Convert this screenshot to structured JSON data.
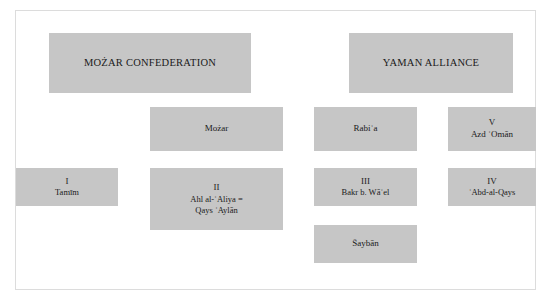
{
  "figure": {
    "type": "tribal-genealogy-diagram",
    "background_color": "#ffffff",
    "box_fill_color": "#c6c6c6",
    "border_color": "#dcdcdc",
    "text_color": "#1a1a1a"
  },
  "nodes": {
    "mozar_confederation": {
      "label": "MOŻAR CONFEDERATION"
    },
    "yaman_alliance": {
      "label": "YAMAN ALLIANCE"
    },
    "mozar": {
      "label": "Możar"
    },
    "rabia": {
      "label": "Rabiʿa"
    },
    "azd_oman": {
      "numeral": "V",
      "label": "Azd ʿOmān"
    },
    "tamim": {
      "numeral": "I",
      "label": "Tamīm"
    },
    "ahl_al_aliya": {
      "numeral": "II",
      "label_line1": "Ahl al-ʿAliya =",
      "label_line2": "Qays ʿAylān"
    },
    "bakr": {
      "numeral": "III",
      "label": "Bakr b. Wāʾel"
    },
    "abd_al_qays": {
      "numeral": "IV",
      "label": "ʿAbd-al-Qays"
    },
    "shayban": {
      "label": "Šaybān"
    }
  }
}
